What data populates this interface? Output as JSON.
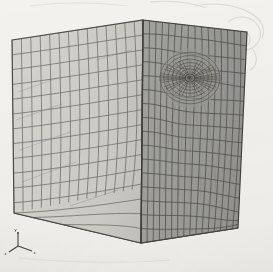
{
  "figure": {
    "medium": "scanned black-and-white halftone figure on off-white paper",
    "background_color": "#f3f2ef",
    "outline_color": "#4a4a48"
  },
  "projection": {
    "type": "isometric",
    "top_apex": [
      143,
      20
    ],
    "left_top": [
      12,
      40
    ],
    "right_top": [
      247,
      32
    ],
    "front_bottom": [
      141,
      243
    ],
    "left_bottom": [
      14,
      213
    ],
    "right_bottom": [
      238,
      228
    ],
    "bottom_rear": [
      112,
      222
    ]
  },
  "faces": [
    {
      "name": "left-face",
      "label": "Left visible face",
      "fill_color": "#d2d0cc",
      "edge_color": "#6a6866",
      "divisions_u": 14,
      "divisions_v": 14,
      "mesh_style": "distorted structured quadrilateral grid",
      "shading": "light"
    },
    {
      "name": "right-face",
      "label": "Right visible face",
      "fill_color": "#9b9b98",
      "edge_color": "#4f4e4c",
      "divisions_u": 16,
      "divisions_v": 16,
      "mesh_style": "graded structured grid warped toward circular refinement",
      "shading": "medium"
    },
    {
      "name": "bottom-face",
      "label": "Bottom face",
      "fill_color": "#7c7b78",
      "edge_color": "#3e3d3b",
      "divisions_u": 26,
      "divisions_v": 14,
      "mesh_style": "fine uniform quadrilateral grid",
      "shading": "dark"
    },
    {
      "name": "top-face",
      "label": "Top face (near edge-on)",
      "fill_color": "#e4e3df",
      "edge_color": "#7d7c79",
      "divisions_u": 14,
      "divisions_v": 3,
      "mesh_style": "foreshortened sliver",
      "shading": "highlight"
    }
  ],
  "refinement": {
    "name": "circular-refinement",
    "label": "Circular mesh refinement zone",
    "center": [
      190,
      78
    ],
    "outer_radius": 30,
    "inner_radius": 4,
    "radial_rings": 9,
    "angular_sectors": 36,
    "core_fill": "#6d6c6a",
    "description": "Radially graded rosette of elements converging on a small circular hole"
  },
  "axis_triad": {
    "name": "axis-triad",
    "label": "Coordinate axis indicator",
    "origin": [
      18,
      246
    ],
    "axes": [
      {
        "name": "x-axis",
        "label": "x",
        "dx": 14,
        "dy": 5
      },
      {
        "name": "y-axis",
        "label": "y",
        "dx": 0,
        "dy": -14
      },
      {
        "name": "z-axis",
        "label": "z",
        "dx": -9,
        "dy": 6
      }
    ],
    "color": "#45443f"
  },
  "artifacts": {
    "name": "scan-artifacts",
    "label": "Faint pencil and scanning marks",
    "color": "#d5d2cb",
    "regions": [
      "top-right corner",
      "upper-left margin",
      "lower margin"
    ]
  }
}
